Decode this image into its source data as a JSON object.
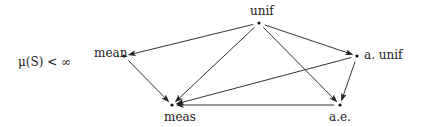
{
  "diagram": {
    "condition_label": "μ(S) < ∞",
    "nodes": [
      {
        "id": "unif",
        "label": "unif",
        "x": 259,
        "y": 23,
        "lx": 250,
        "ly": 15,
        "anchor": "start"
      },
      {
        "id": "a_unif",
        "label": "a. unif",
        "x": 357,
        "y": 56,
        "lx": 364,
        "ly": 59,
        "anchor": "start"
      },
      {
        "id": "ae",
        "label": "a.e.",
        "x": 340,
        "y": 105,
        "lx": 329,
        "ly": 121,
        "anchor": "start"
      },
      {
        "id": "mean",
        "label": "mean",
        "x": 124,
        "y": 56,
        "lx": 94,
        "ly": 57,
        "anchor": "start"
      },
      {
        "id": "meas",
        "label": "meas",
        "x": 172,
        "y": 105,
        "lx": 164,
        "ly": 121,
        "anchor": "start"
      }
    ],
    "edges": [
      {
        "from": "unif",
        "to": "mean"
      },
      {
        "from": "unif",
        "to": "meas"
      },
      {
        "from": "unif",
        "to": "a_unif"
      },
      {
        "from": "unif",
        "to": "ae"
      },
      {
        "from": "mean",
        "to": "meas"
      },
      {
        "from": "a_unif",
        "to": "meas"
      },
      {
        "from": "a_unif",
        "to": "ae"
      },
      {
        "from": "ae",
        "to": "meas"
      }
    ]
  }
}
